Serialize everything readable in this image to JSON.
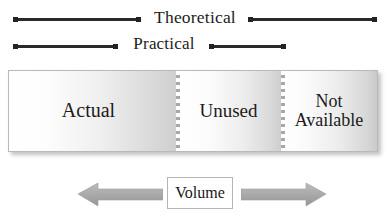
{
  "diagram": {
    "brackets": [
      {
        "label": "Theoretical",
        "name": "theoretical"
      },
      {
        "label": "Practical",
        "name": "practical"
      }
    ],
    "capacity_bar": {
      "segments": [
        {
          "label": "Actual",
          "name": "actual"
        },
        {
          "label": "Unused",
          "name": "unused"
        },
        {
          "label": "Not\nAvailable",
          "name": "not-available"
        }
      ]
    },
    "volume": {
      "label": "Volume",
      "left_arrow": "arrow-left",
      "right_arrow": "arrow-right"
    },
    "colors": {
      "line": "#2a2a2a",
      "text": "#1b1b1b",
      "bar_border": "#b9b9b9",
      "arrow_fill": "#a6a6a6",
      "divider": "#a8a8a8",
      "background": "#ffffff"
    }
  }
}
